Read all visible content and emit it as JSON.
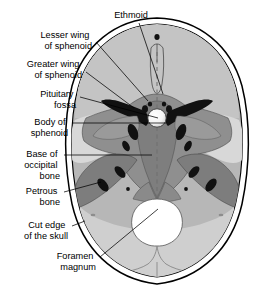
{
  "figure": {
    "name": "skull-base-superior-view",
    "background_color": "#ffffff"
  },
  "palette": {
    "outline": "#000000",
    "cut_edge_fill": "#ffffff",
    "vault_gray": "#b7b7b7",
    "light_gray": "#d2d2d2",
    "mid_gray": "#a8a8a8",
    "dark_gray": "#8a8a8a",
    "darkest_gray": "#7a7a7a",
    "black_foramen": "#111111",
    "white_fossa": "#ffffff",
    "label_text": "#000000",
    "leader_line": "#000000",
    "midline_dash": "#6e6e6e"
  },
  "labels": [
    {
      "id": "ethmoid",
      "name": "label-ethmoid",
      "lines": [
        "Ethmoid"
      ],
      "anchor": "middle",
      "text_x": 131,
      "text_y": 16,
      "leader": "M 139 23 L 163 94"
    },
    {
      "id": "lesser-wing-of-sphenoid",
      "name": "label-lesser-wing-of-sphenoid",
      "lines": [
        "Lesser wing",
        "of sphenoid"
      ],
      "anchor": "end",
      "text_x": 92,
      "text_y": 36,
      "leader": "M 96 42 L 148 101"
    },
    {
      "id": "greater-wing-of-sphenoid",
      "name": "label-greater-wing-of-sphenoid",
      "lines": [
        "Greater wing",
        "of sphenoid"
      ],
      "anchor": "end",
      "text_x": 82,
      "text_y": 65,
      "leader": "M 86 72 L 134 108"
    },
    {
      "id": "pituitary-fossa",
      "name": "label-pituitary-fossa",
      "lines": [
        "Pituitary",
        "fossa"
      ],
      "anchor": "end",
      "text_x": 76,
      "text_y": 95,
      "leader": "M 80 97 L 158 118"
    },
    {
      "id": "body-of-sphenoid",
      "name": "label-body-of-sphenoid",
      "lines": [
        "Body of",
        "sphenoid"
      ],
      "anchor": "end",
      "text_x": 68,
      "text_y": 123,
      "leader": "M 72 123 L 166 123"
    },
    {
      "id": "base-of-occipital-bone",
      "name": "label-base-of-occipital-bone",
      "lines": [
        "Base of",
        "occipital",
        "bone"
      ],
      "anchor": "end",
      "text_x": 60,
      "text_y": 160,
      "leader": "M 64 155 L 152 155"
    },
    {
      "id": "petrous-bone",
      "name": "label-petrous-bone",
      "lines": [
        "Petrous",
        "bone"
      ],
      "anchor": "end",
      "text_x": 60,
      "text_y": 196,
      "leader": "M 64 192 L 101 182"
    },
    {
      "id": "cut-edge-of-the-skull",
      "name": "label-cut-edge-of-the-skull",
      "lines": [
        "Cut edge",
        "of the skull"
      ],
      "anchor": "end",
      "text_x": 68,
      "text_y": 231,
      "leader": "M 72 226 L 85 221"
    },
    {
      "id": "foramen-magnum",
      "name": "label-foramen-magnum",
      "lines": [
        "Foramen",
        "magnum"
      ],
      "anchor": "end",
      "text_x": 96,
      "text_y": 262,
      "leader": "M 100 257 L 158 209"
    }
  ],
  "structures": [
    {
      "id": "skull-outer-edge",
      "name": "skull-outer-cut-edge",
      "description": "Outer cut edge of the cranial vault"
    },
    {
      "id": "skull-inner-edge",
      "name": "skull-inner-cut-edge",
      "description": "Inner cut edge of the cranial vault"
    },
    {
      "id": "anterior-cranial-fossa",
      "name": "anterior-cranial-fossa",
      "description": "Anterior cranial fossa, frontal region"
    },
    {
      "id": "crista-galli",
      "name": "crista-galli",
      "description": "Crista galli and cribriform plate of ethmoid"
    },
    {
      "id": "lesser-wing-left",
      "name": "lesser-wing-of-sphenoid-left",
      "description": "Left lesser wing of sphenoid"
    },
    {
      "id": "lesser-wing-right",
      "name": "lesser-wing-of-sphenoid-right",
      "description": "Right lesser wing of sphenoid"
    },
    {
      "id": "greater-wing-left",
      "name": "greater-wing-of-sphenoid-left",
      "description": "Left greater wing of sphenoid"
    },
    {
      "id": "greater-wing-right",
      "name": "greater-wing-of-sphenoid-right",
      "description": "Right greater wing of sphenoid"
    },
    {
      "id": "sella-turcica",
      "name": "pituitary-fossa-sella-turcica",
      "description": "Pituitary fossa (sella turcica)"
    },
    {
      "id": "sphenoid-body",
      "name": "body-of-sphenoid",
      "description": "Body of the sphenoid bone"
    },
    {
      "id": "petrous-left",
      "name": "petrous-temporal-bone-left",
      "description": "Left petrous part of temporal bone"
    },
    {
      "id": "petrous-right",
      "name": "petrous-temporal-bone-right",
      "description": "Right petrous part of temporal bone"
    },
    {
      "id": "occipital-base",
      "name": "base-of-occipital-bone",
      "description": "Basilar part of occipital bone"
    },
    {
      "id": "foramen-magnum",
      "name": "foramen-magnum",
      "description": "Foramen magnum aperture"
    },
    {
      "id": "midline",
      "name": "midsagittal-dashed-line",
      "description": "Dashed midsagittal reference line"
    }
  ]
}
